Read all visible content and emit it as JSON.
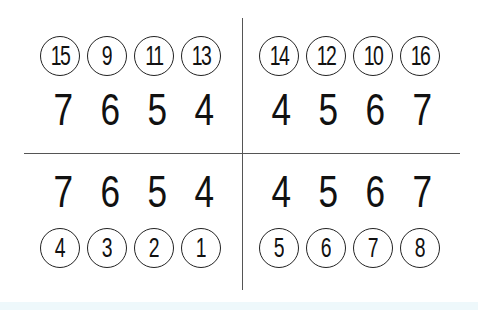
{
  "quadrants": {
    "top_left": {
      "circled": [
        "15",
        "9",
        "11",
        "13"
      ],
      "digits": [
        "7",
        "6",
        "5",
        "4"
      ]
    },
    "top_right": {
      "circled": [
        "14",
        "12",
        "10",
        "16"
      ],
      "digits": [
        "4",
        "5",
        "6",
        "7"
      ]
    },
    "bottom_left": {
      "digits": [
        "7",
        "6",
        "5",
        "4"
      ],
      "circled": [
        "4",
        "3",
        "2",
        "1"
      ]
    },
    "bottom_right": {
      "digits": [
        "4",
        "5",
        "6",
        "7"
      ],
      "circled": [
        "5",
        "6",
        "7",
        "8"
      ]
    }
  },
  "colors": {
    "ink": "#111111",
    "divider": "#555555",
    "background": "#ffffff"
  }
}
